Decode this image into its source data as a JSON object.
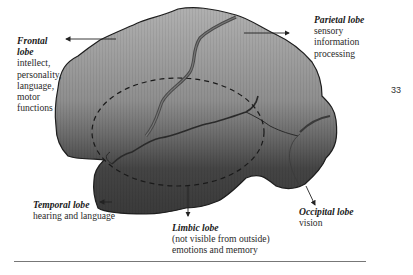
{
  "page_number": "33",
  "labels": {
    "frontal": {
      "title": "Frontal lobe",
      "title_lines": [
        "Frontal",
        "lobe"
      ],
      "lines": [
        "intellect,",
        "personality,",
        "language,",
        "motor",
        "functions"
      ]
    },
    "parietal": {
      "title": "Parietal lobe",
      "lines": [
        "sensory",
        "information",
        "processing"
      ]
    },
    "temporal": {
      "title": "Temporal lobe",
      "lines": [
        "hearing and language"
      ]
    },
    "limbic": {
      "title": "Limbic lobe",
      "lines": [
        "(not visible from outside)",
        "emotions and  memory"
      ]
    },
    "occipital": {
      "title": "Occipital lobe",
      "lines": [
        "vision"
      ]
    }
  },
  "colors": {
    "brain_top": "#a8a8a8",
    "brain_mid": "#8a8a8a",
    "brain_bottom": "#3e3e3e",
    "outline": "#1e1e1e",
    "fissure": "#4a4a4a",
    "rule": "#777777"
  }
}
